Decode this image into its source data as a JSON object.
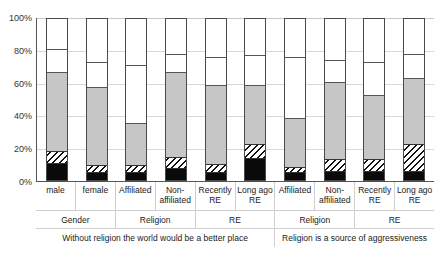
{
  "chart_data": {
    "type": "bar",
    "title": "",
    "subtitle": "",
    "xlabel": "",
    "ylabel": "",
    "ylim": [
      0,
      100
    ],
    "grid": true,
    "stacked": true,
    "stack_percent": true,
    "legend_position": "none",
    "y_ticks": [
      "0%",
      "20%",
      "40%",
      "60%",
      "80%",
      "100%"
    ],
    "y_tick_values": [
      0,
      20,
      40,
      60,
      80,
      100
    ],
    "categories": [
      "male",
      "female",
      "Affiliated",
      "Non-affiliated",
      "Recently RE",
      "Long ago RE",
      "Affiliated",
      "Non-affiliated",
      "Recently RE",
      "Long ago RE"
    ],
    "group_labels": [
      "Gender",
      "Religion",
      "RE",
      "Religion",
      "RE"
    ],
    "group_spans": [
      2,
      2,
      2,
      2,
      2
    ],
    "topic_labels": [
      "Without religion the world would be a better place",
      "Religion is a source of aggressiveness"
    ],
    "topic_spans": [
      6,
      4
    ],
    "series": [
      {
        "name": "black",
        "fill": "solid-black",
        "values": [
          10,
          4,
          4,
          7,
          4,
          13,
          4,
          5,
          5,
          5
        ]
      },
      {
        "name": "hatched",
        "fill": "diagonal-hatch",
        "values": [
          8,
          5,
          5,
          7,
          6,
          9,
          4,
          8,
          8,
          17
        ]
      },
      {
        "name": "gray",
        "fill": "solid-gray",
        "values": [
          48,
          48,
          26,
          52,
          48,
          36,
          30,
          47,
          39,
          40
        ]
      },
      {
        "name": "white",
        "fill": "solid-white",
        "values": [
          14,
          15,
          35,
          11,
          17,
          18,
          37,
          13,
          20,
          15
        ]
      }
    ],
    "segment_tops_percent": [
      [
        10,
        18,
        66,
        100
      ],
      [
        4,
        9,
        57,
        100
      ],
      [
        4,
        9,
        35,
        100
      ],
      [
        7,
        14,
        66,
        100
      ],
      [
        4,
        10,
        58,
        100
      ],
      [
        13,
        22,
        58,
        100
      ],
      [
        4,
        8,
        38,
        100
      ],
      [
        5,
        13,
        60,
        100
      ],
      [
        5,
        13,
        52,
        100
      ],
      [
        5,
        22,
        62,
        100
      ]
    ],
    "colors": {
      "black": "#0a0a0a",
      "hatch_line": "#111111",
      "gray": "#c6c6c6",
      "white": "#ffffff",
      "bar_border": "#4a4a4a",
      "gridline": "#d8d8d8",
      "axis": "#555555",
      "text": "#222222"
    }
  }
}
